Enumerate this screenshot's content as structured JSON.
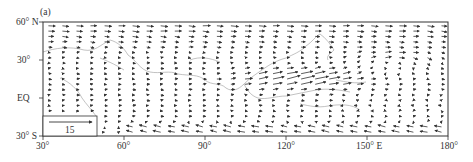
{
  "figure": {
    "panel_label": "(a)",
    "legend": {
      "value_label": "15"
    }
  },
  "chart_data": {
    "type": "quiver",
    "title": "(a)",
    "xlabel": "",
    "ylabel": "",
    "x_ticks": [
      "30°",
      "60°",
      "90°",
      "120°",
      "150° E",
      "180°"
    ],
    "x_tick_values": [
      30,
      60,
      90,
      120,
      150,
      180
    ],
    "y_ticks": [
      "60° N",
      "30°",
      "EQ",
      "30° S"
    ],
    "y_tick_values": [
      60,
      30,
      0,
      -30
    ],
    "xlim": [
      30,
      180
    ],
    "ylim": [
      -30,
      60
    ],
    "reference_vector": {
      "label": "15",
      "direction": "east"
    },
    "grid": false,
    "features": [
      "strong westerly/northwesterly jet over 90°E–150°E around 5°N–25°N",
      "anticyclonic circulation near 150°E–170°E, 20°N–35°N",
      "strong southeasterly flow along southern boundary 60°E–180°",
      "weak mixed flow in midlatitudes 30°E–90°E"
    ]
  }
}
